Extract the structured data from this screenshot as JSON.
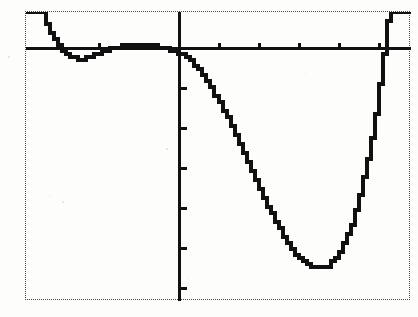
{
  "device": {
    "label": "graphing-calculator-screen",
    "screen_border_style": "dotted",
    "screen_border_color": "#4a4a4a",
    "background_color": "#fdfdfc",
    "trace_color": "#111111"
  },
  "chart_data": {
    "type": "line",
    "title": "",
    "subtitle": "",
    "xlabel": "",
    "ylabel": "",
    "grid": false,
    "legend_position": "none",
    "axis_style": "calculator-crosshair-axes",
    "tick_mark_spacing_units": 1,
    "xlim": [
      -3.8,
      5.8
    ],
    "ylim": [
      -6.1,
      1.0
    ],
    "x_tick_values": [
      -3,
      -2,
      -1,
      1,
      2,
      3,
      4,
      5
    ],
    "y_tick_values": [
      -1,
      -2,
      -3,
      -4,
      -5,
      -6
    ],
    "annotations": [
      "left branch falls steeply from top of window",
      "local maximum just above x-axis slightly left of y-axis",
      "curve crosses x-axis near x = 0.05",
      "global minimum near x = 3.1, y = -6.0",
      "right branch rises steeply past x = 4.4 to top of window"
    ],
    "series": [
      {
        "name": "y1",
        "x": [
          -3.8,
          -3.7,
          -3.6,
          -3.5,
          -3.4,
          -3.3,
          -3.2,
          -3.1,
          -3.0,
          -2.9,
          -2.8,
          -2.7,
          -2.6,
          -2.5,
          -2.4,
          -2.3,
          -2.2,
          -2.1,
          -2.0,
          -1.9,
          -1.8,
          -1.7,
          -1.6,
          -1.5,
          -1.4,
          -1.3,
          -1.2,
          -1.1,
          -1.0,
          -0.9,
          -0.8,
          -0.7,
          -0.6,
          -0.5,
          -0.4,
          -0.3,
          -0.2,
          -0.1,
          0.0,
          0.1,
          0.2,
          0.3,
          0.4,
          0.5,
          0.6,
          0.7,
          0.8,
          0.9,
          1.0,
          1.1,
          1.2,
          1.3,
          1.4,
          1.5,
          1.6,
          1.7,
          1.8,
          1.9,
          2.0,
          2.1,
          2.2,
          2.3,
          2.4,
          2.5,
          2.6,
          2.7,
          2.8,
          2.9,
          3.0,
          3.1,
          3.2,
          3.3,
          3.4,
          3.5,
          3.6,
          3.7,
          3.8,
          3.9,
          4.0,
          4.1,
          4.2,
          4.3,
          4.4,
          4.5,
          4.6,
          4.7,
          4.8,
          4.9,
          5.0,
          5.1,
          5.2,
          5.3,
          5.4,
          5.5,
          5.6,
          5.7,
          5.8
        ],
        "y": [
          1.0,
          1.0,
          1.0,
          1.0,
          0.97,
          0.72,
          0.5,
          0.31,
          0.16,
          0.04,
          -0.05,
          -0.11,
          -0.14,
          -0.15,
          -0.15,
          -0.13,
          -0.1,
          -0.06,
          -0.02,
          0.02,
          0.06,
          0.09,
          0.12,
          0.15,
          0.17,
          0.19,
          0.2,
          0.21,
          0.21,
          0.21,
          0.2,
          0.19,
          0.17,
          0.15,
          0.13,
          0.1,
          0.07,
          0.04,
          0.0,
          -0.05,
          -0.12,
          -0.2,
          -0.3,
          -0.42,
          -0.55,
          -0.7,
          -0.86,
          -1.03,
          -1.22,
          -1.41,
          -1.61,
          -1.82,
          -2.03,
          -2.25,
          -2.47,
          -2.69,
          -2.91,
          -3.13,
          -3.35,
          -3.56,
          -3.77,
          -3.97,
          -4.16,
          -4.34,
          -4.51,
          -4.67,
          -4.81,
          -4.94,
          -5.05,
          -5.14,
          -5.21,
          -5.26,
          -5.29,
          -5.3,
          -5.28,
          -5.23,
          -5.15,
          -5.04,
          -4.89,
          -4.7,
          -4.47,
          -4.2,
          -3.88,
          -3.51,
          -3.09,
          -2.61,
          -2.07,
          -1.47,
          -0.8,
          -0.06,
          0.75,
          1.0,
          1.0,
          1.0,
          1.0,
          1.0,
          1.0
        ]
      }
    ]
  }
}
